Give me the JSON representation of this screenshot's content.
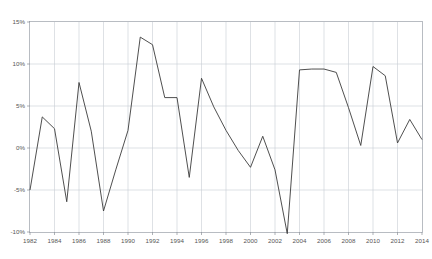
{
  "chart_data": {
    "type": "line",
    "title": "",
    "subtitle": "",
    "xlabel": "",
    "ylabel": "",
    "xlim": [
      1982,
      2014
    ],
    "ylim": [
      -10,
      15
    ],
    "grid": true,
    "legend": null,
    "y_tick_labels": [
      "15%",
      "10%",
      "5%",
      "0%",
      "-5%",
      "-10%"
    ],
    "y_tick_values": [
      15,
      10,
      5,
      0,
      -5,
      -10
    ],
    "x_tick_labels": [
      "1982",
      "1984",
      "1986",
      "1988",
      "1990",
      "1992",
      "1994",
      "1996",
      "1998",
      "2000",
      "2002",
      "2004",
      "2006",
      "2008",
      "2010",
      "2012",
      "2014"
    ],
    "x_tick_values": [
      1982,
      1984,
      1986,
      1988,
      1990,
      1992,
      1994,
      1996,
      1998,
      2000,
      2002,
      2004,
      2006,
      2008,
      2010,
      2012,
      2014
    ],
    "series": [
      {
        "name": "value",
        "color": "#3b3b3b",
        "x": [
          1982,
          1983,
          1984,
          1985,
          1986,
          1987,
          1988,
          1989,
          1990,
          1991,
          1992,
          1993,
          1994,
          1995,
          1996,
          1997,
          1998,
          1999,
          2000,
          2001,
          2002,
          2003,
          2004,
          2005,
          2006,
          2007,
          2008,
          2009,
          2010,
          2011,
          2012,
          2013,
          2014
        ],
        "values": [
          -5.0,
          3.7,
          2.3,
          -6.4,
          7.8,
          2.0,
          -7.5,
          -2.6,
          2.1,
          13.2,
          12.3,
          6.0,
          6.0,
          -3.5,
          8.3,
          4.9,
          2.1,
          -0.3,
          -2.3,
          1.4,
          -2.6,
          -10.2,
          9.3,
          9.4,
          9.4,
          9.0,
          4.8,
          0.3,
          9.7,
          8.6,
          0.6,
          3.4,
          1.0
        ]
      }
    ]
  },
  "accent_color": "#3b3b3b",
  "grid_color": "#c8cdd4",
  "frame_color": "#9aa0a8",
  "background_color": "#ffffff"
}
